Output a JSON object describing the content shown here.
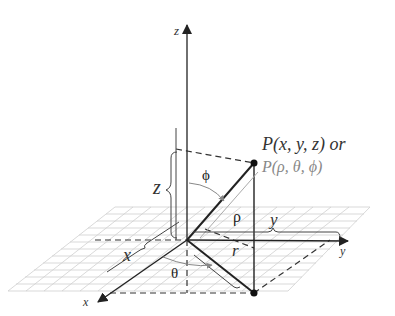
{
  "figure": {
    "axes": {
      "x_label": "x",
      "y_label": "y",
      "z_label": "z"
    },
    "point": {
      "cartesian_label": "P(x, y, z) or",
      "spherical_label": "P(ρ, θ, ϕ)"
    },
    "measures": {
      "z_brace": "z",
      "x_brace": "x",
      "y_brace": "y",
      "rho": "ρ",
      "r": "r",
      "theta": "θ",
      "phi": "ϕ"
    },
    "colors": {
      "axis": "#222222",
      "grid": "#c8c8c8",
      "dashed": "#333333",
      "spherical_label": "#888888",
      "rho_line": "#aaaaaa"
    }
  }
}
